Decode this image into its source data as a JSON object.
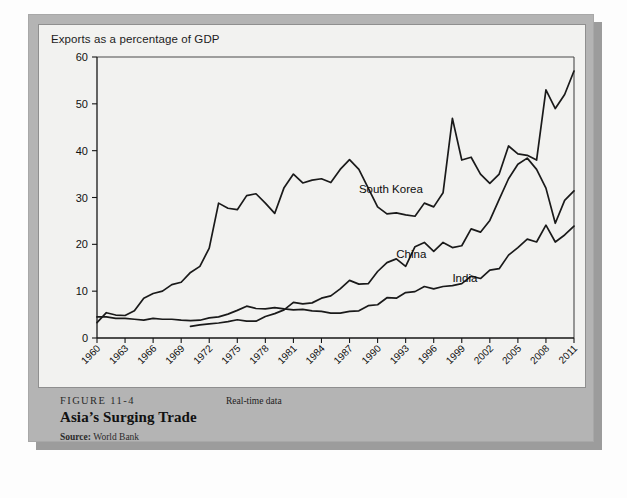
{
  "figure": {
    "number": "FIGURE 11-4",
    "title": "Asia’s Surging Trade",
    "source_label": "Source:",
    "source_value": "World Bank",
    "realtime_note": "Real-time data"
  },
  "chart_data": {
    "type": "line",
    "title": "",
    "subtitle": "Exports as a percentage of GDP",
    "xlabel": "",
    "ylabel": "",
    "ylim": [
      0,
      60
    ],
    "yticks": [
      0,
      10,
      20,
      30,
      40,
      50,
      60
    ],
    "xlim": [
      1960,
      2011
    ],
    "xticks": [
      1960,
      1963,
      1966,
      1969,
      1972,
      1975,
      1978,
      1981,
      1984,
      1987,
      1990,
      1993,
      1996,
      1999,
      2002,
      2005,
      2008,
      2011
    ],
    "grid": false,
    "legend_position": "inline-labels",
    "line_color": "#1a1a1a",
    "series": [
      {
        "name": "South Korea",
        "label_year": 1988,
        "label_value": 31,
        "x": [
          1960,
          1961,
          1962,
          1963,
          1964,
          1965,
          1966,
          1967,
          1968,
          1969,
          1970,
          1971,
          1972,
          1973,
          1974,
          1975,
          1976,
          1977,
          1978,
          1979,
          1980,
          1981,
          1982,
          1983,
          1984,
          1985,
          1986,
          1987,
          1988,
          1989,
          1990,
          1991,
          1992,
          1993,
          1994,
          1995,
          1996,
          1997,
          1998,
          1999,
          2000,
          2001,
          2002,
          2003,
          2004,
          2005,
          2006,
          2007,
          2008,
          2009,
          2010,
          2011
        ],
        "y": [
          3.3,
          5.4,
          4.9,
          4.8,
          5.8,
          8.5,
          9.5,
          10.0,
          11.4,
          11.9,
          14.0,
          15.3,
          19.2,
          28.8,
          27.7,
          27.4,
          30.4,
          30.8,
          28.8,
          26.6,
          32.1,
          35.0,
          33.1,
          33.7,
          34.0,
          33.2,
          36.0,
          38.1,
          36.0,
          32.0,
          28.0,
          26.5,
          26.7,
          26.3,
          26.0,
          28.8,
          28.0,
          31.0,
          46.9,
          38.0,
          38.6,
          35.0,
          33.0,
          35.0,
          41.0,
          39.3,
          39.0,
          38.0,
          53.0,
          49.0,
          52.0,
          57.0
        ]
      },
      {
        "name": "China",
        "label_year": 1992,
        "label_value": 17,
        "x": [
          1970,
          1971,
          1972,
          1973,
          1974,
          1975,
          1976,
          1977,
          1978,
          1979,
          1980,
          1981,
          1982,
          1983,
          1984,
          1985,
          1986,
          1987,
          1988,
          1989,
          1990,
          1991,
          1992,
          1993,
          1994,
          1995,
          1996,
          1997,
          1998,
          1999,
          2000,
          2001,
          2002,
          2003,
          2004,
          2005,
          2006,
          2007,
          2008,
          2009,
          2010,
          2011
        ],
        "y": [
          2.5,
          2.8,
          3.0,
          3.2,
          3.5,
          3.9,
          3.6,
          3.6,
          4.6,
          5.2,
          6.0,
          7.6,
          7.3,
          7.5,
          8.5,
          9.0,
          10.5,
          12.3,
          11.5,
          11.6,
          14.2,
          16.1,
          16.9,
          15.3,
          19.5,
          20.4,
          18.5,
          20.4,
          19.3,
          19.7,
          23.3,
          22.6,
          25.1,
          29.6,
          34.0,
          37.1,
          38.4,
          36.0,
          32.0,
          24.5,
          29.4,
          31.4
        ]
      },
      {
        "name": "India",
        "label_year": 1998,
        "label_value": 12,
        "x": [
          1960,
          1961,
          1962,
          1963,
          1964,
          1965,
          1966,
          1967,
          1968,
          1969,
          1970,
          1971,
          1972,
          1973,
          1974,
          1975,
          1976,
          1977,
          1978,
          1979,
          1980,
          1981,
          1982,
          1983,
          1984,
          1985,
          1986,
          1987,
          1988,
          1989,
          1990,
          1991,
          1992,
          1993,
          1994,
          1995,
          1996,
          1997,
          1998,
          1999,
          2000,
          2001,
          2002,
          2003,
          2004,
          2005,
          2006,
          2007,
          2008,
          2009,
          2010,
          2011
        ],
        "y": [
          4.5,
          4.5,
          4.2,
          4.2,
          4.0,
          3.8,
          4.2,
          4.0,
          4.0,
          3.8,
          3.7,
          3.8,
          4.3,
          4.5,
          5.1,
          5.9,
          6.8,
          6.3,
          6.2,
          6.5,
          6.2,
          6.0,
          6.1,
          5.8,
          5.7,
          5.3,
          5.3,
          5.7,
          5.8,
          6.9,
          7.1,
          8.6,
          8.5,
          9.7,
          9.9,
          11.0,
          10.5,
          11.0,
          11.2,
          11.6,
          13.2,
          12.7,
          14.5,
          14.8,
          17.7,
          19.3,
          21.1,
          20.5,
          24.1,
          20.5,
          22.0,
          23.9
        ]
      }
    ]
  }
}
